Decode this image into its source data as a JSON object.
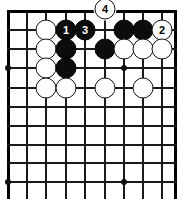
{
  "figure": {
    "kind": "go-board-diagram",
    "board": {
      "columns": 10,
      "rows": 10,
      "origin_x": 8,
      "origin_y": 11,
      "spacing_x": 19.3,
      "spacing_y": 19.0,
      "right_edge_x": 175,
      "line_color": "#1a1a1a",
      "edge_color": "#000000",
      "background_color": "#ffffff",
      "star_points": [
        {
          "x": 8,
          "y": 68
        },
        {
          "x": 124,
          "y": 68
        },
        {
          "x": 8,
          "y": 182
        },
        {
          "x": 124,
          "y": 182
        }
      ]
    },
    "stone_colors": {
      "black_fill": "#0c0c0c",
      "black_label": "#ffffff",
      "white_fill": "#ffffff",
      "white_outline": "#151515",
      "white_label": "#000000"
    },
    "stones": [
      {
        "id": "w-c3-r1",
        "color": "white",
        "label": "",
        "x": 46,
        "y": 30
      },
      {
        "id": "b-move-1",
        "color": "black",
        "label": "1",
        "x": 66,
        "y": 30
      },
      {
        "id": "b-move-3",
        "color": "black",
        "label": "3",
        "x": 85,
        "y": 30
      },
      {
        "id": "b-c7-r1",
        "color": "black",
        "label": "",
        "x": 124,
        "y": 30
      },
      {
        "id": "b-c8-r1",
        "color": "black",
        "label": "",
        "x": 143,
        "y": 30
      },
      {
        "id": "w-move-2",
        "color": "white",
        "label": "2",
        "x": 162,
        "y": 30
      },
      {
        "id": "w-c3-r2",
        "color": "white",
        "label": "",
        "x": 46,
        "y": 49
      },
      {
        "id": "b-c4-r2",
        "color": "black",
        "label": "",
        "x": 66,
        "y": 49
      },
      {
        "id": "b-c6-r2",
        "color": "black",
        "label": "",
        "x": 105,
        "y": 49
      },
      {
        "id": "w-c7-r2",
        "color": "white",
        "label": "",
        "x": 124,
        "y": 49
      },
      {
        "id": "w-c8-r2",
        "color": "white",
        "label": "",
        "x": 143,
        "y": 49
      },
      {
        "id": "w-c9-r2",
        "color": "white",
        "label": "",
        "x": 162,
        "y": 49
      },
      {
        "id": "w-c3-r3",
        "color": "white",
        "label": "",
        "x": 46,
        "y": 68
      },
      {
        "id": "b-c4-r3",
        "color": "black",
        "label": "",
        "x": 66,
        "y": 68
      },
      {
        "id": "w-c3-r4",
        "color": "white",
        "label": "",
        "x": 46,
        "y": 88
      },
      {
        "id": "w-c4-r4",
        "color": "white",
        "label": "",
        "x": 66,
        "y": 88
      },
      {
        "id": "w-c6-r4",
        "color": "white",
        "label": "",
        "x": 105,
        "y": 88
      },
      {
        "id": "w-c8-r4",
        "color": "white",
        "label": "",
        "x": 143,
        "y": 88
      },
      {
        "id": "w-move-4",
        "color": "white",
        "label": "4",
        "x": 105,
        "y": 9
      }
    ],
    "move_labels": [
      "1",
      "2",
      "3",
      "4"
    ]
  }
}
